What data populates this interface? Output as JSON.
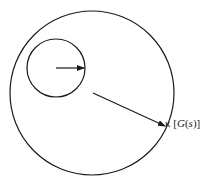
{
  "diagram": {
    "label": "κ [G(s)]",
    "label_parts": {
      "kappa": "κ",
      "open": " [",
      "G": "G",
      "paren_open": "(",
      "s": "s",
      "paren_close": ")",
      "close": "]"
    },
    "stroke_color": "#1a1a1a",
    "background": "#ffffff"
  }
}
